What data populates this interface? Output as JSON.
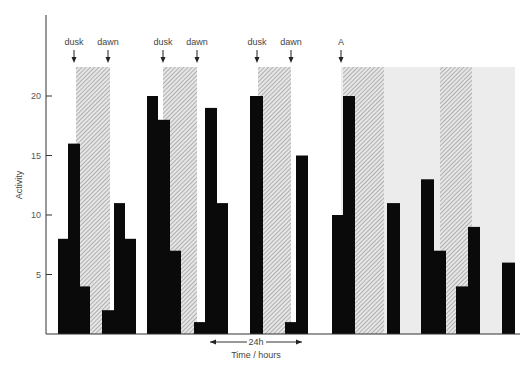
{
  "chart_data": {
    "type": "bar",
    "title": "",
    "xlabel": "Time / hours",
    "ylabel": "Activity",
    "ylim": [
      0,
      25
    ],
    "yticks": [
      5,
      10,
      15,
      20
    ],
    "grid": false,
    "scale_bar": {
      "label": "24h",
      "x_from": 210,
      "x_to": 302
    },
    "annotations": [
      {
        "text": "dusk",
        "x": 74
      },
      {
        "text": "dawn",
        "x": 108
      },
      {
        "text": "dusk",
        "x": 163
      },
      {
        "text": "dawn",
        "x": 197
      },
      {
        "text": "dusk",
        "x": 257
      },
      {
        "text": "dawn",
        "x": 291
      },
      {
        "text": "A",
        "x": 341
      }
    ],
    "dark_periods": [
      {
        "x0": 76,
        "x1": 110,
        "style": "hatched"
      },
      {
        "x0": 163,
        "x1": 197,
        "style": "hatched"
      },
      {
        "x0": 258,
        "x1": 291,
        "style": "hatched"
      }
    ],
    "constant_dark": {
      "x0": 341,
      "x1": 515,
      "hatched_segments": [
        [
          343,
          384
        ],
        [
          440,
          472
        ]
      ]
    },
    "bars": [
      {
        "x0": 58,
        "x1": 68,
        "value": 8
      },
      {
        "x0": 68,
        "x1": 80,
        "value": 16
      },
      {
        "x0": 80,
        "x1": 90,
        "value": 4
      },
      {
        "x0": 102,
        "x1": 114,
        "value": 2
      },
      {
        "x0": 114,
        "x1": 125,
        "value": 11
      },
      {
        "x0": 125,
        "x1": 136,
        "value": 8
      },
      {
        "x0": 147,
        "x1": 158,
        "value": 20
      },
      {
        "x0": 158,
        "x1": 170,
        "value": 18
      },
      {
        "x0": 170,
        "x1": 181,
        "value": 7
      },
      {
        "x0": 194,
        "x1": 205,
        "value": 1
      },
      {
        "x0": 205,
        "x1": 217,
        "value": 19
      },
      {
        "x0": 217,
        "x1": 228,
        "value": 11
      },
      {
        "x0": 250,
        "x1": 263,
        "value": 20
      },
      {
        "x0": 285,
        "x1": 296,
        "value": 1
      },
      {
        "x0": 296,
        "x1": 308,
        "value": 15
      },
      {
        "x0": 332,
        "x1": 343,
        "value": 10
      },
      {
        "x0": 343,
        "x1": 355,
        "value": 20
      },
      {
        "x0": 387,
        "x1": 400,
        "value": 11
      },
      {
        "x0": 421,
        "x1": 434,
        "value": 13
      },
      {
        "x0": 434,
        "x1": 446,
        "value": 7
      },
      {
        "x0": 456,
        "x1": 468,
        "value": 4
      },
      {
        "x0": 468,
        "x1": 480,
        "value": 9
      },
      {
        "x0": 502,
        "x1": 515,
        "value": 6
      }
    ]
  },
  "axis": {
    "origin_y": 334,
    "px_per_unit": 11.9,
    "axis_x": 46,
    "top_y": 15,
    "x_end": 520,
    "region_top": 67
  }
}
